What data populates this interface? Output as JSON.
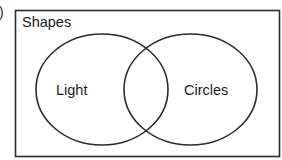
{
  "figure": {
    "panel_label": ")",
    "universe": {
      "label": "Shapes"
    },
    "sets": [
      {
        "label": "Light"
      },
      {
        "label": "Circles"
      }
    ],
    "colors": {
      "stroke": "#2b2b2b",
      "text": "#1a1a1a",
      "background": "#ffffff"
    }
  }
}
